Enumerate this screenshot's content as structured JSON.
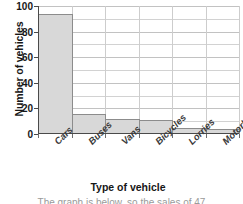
{
  "chart_data": {
    "type": "bar",
    "title": "",
    "xlabel": "Type of vehicle",
    "ylabel": "Number of vehicles",
    "categories": [
      "Cars",
      "Buses",
      "Vans",
      "Bicycles",
      "Lorries",
      "Motorbikes"
    ],
    "values": [
      94,
      16,
      12,
      11,
      5,
      4
    ],
    "ylim": [
      0,
      100
    ],
    "ytick_labels": [
      "0",
      "20",
      "40",
      "60",
      "80",
      "100"
    ],
    "ytick_values": [
      0,
      20,
      40,
      60,
      80,
      100
    ],
    "minor_gridline_values": [
      10,
      30,
      50,
      70,
      90
    ],
    "grid": true,
    "legend": false,
    "bar_fill_color": "#d8d8d8",
    "bar_edge_color": "#8c8c8c",
    "grid_color": "#d2d2d2",
    "axis_color": "#4a4a4a",
    "bars_adjacent": true,
    "xtick_label_rotation": -45
  },
  "caption": {
    "fragment": "The graph is  below, so the  sales of 47"
  }
}
